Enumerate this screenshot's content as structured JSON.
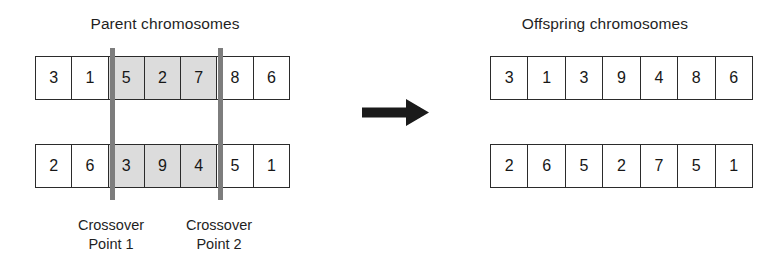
{
  "figure": {
    "name": "two-point-crossover",
    "background_color": "#ffffff",
    "line_color": "#2b2b2b",
    "shaded_gene_color": "#dcdcdc",
    "crossover_bar_color": "#7d7d7d",
    "arrow_color": "#1a1a1a"
  },
  "parent": {
    "title": "Parent chromosomes",
    "rows": [
      {
        "name": "parent-chromosome-1",
        "genes": [
          "3",
          "1",
          "5",
          "2",
          "7",
          "8",
          "6"
        ],
        "shaded_indices": [
          2,
          3,
          4
        ]
      },
      {
        "name": "parent-chromosome-2",
        "genes": [
          "2",
          "6",
          "3",
          "9",
          "4",
          "5",
          "1"
        ],
        "shaded_indices": [
          2,
          3,
          4
        ]
      }
    ]
  },
  "offspring": {
    "title": "Offspring chromosomes",
    "rows": [
      {
        "name": "offspring-chromosome-1",
        "genes": [
          "3",
          "1",
          "3",
          "9",
          "4",
          "8",
          "6"
        ],
        "shaded_indices": []
      },
      {
        "name": "offspring-chromosome-2",
        "genes": [
          "2",
          "6",
          "5",
          "2",
          "7",
          "5",
          "1"
        ],
        "shaded_indices": []
      }
    ]
  },
  "crossover_points": [
    {
      "line_1": "Crossover",
      "line_2": "Point 1"
    },
    {
      "line_1": "Crossover",
      "line_2": "Point 2"
    }
  ],
  "arrow": {
    "icon": "right-arrow-icon",
    "direction": "right"
  }
}
